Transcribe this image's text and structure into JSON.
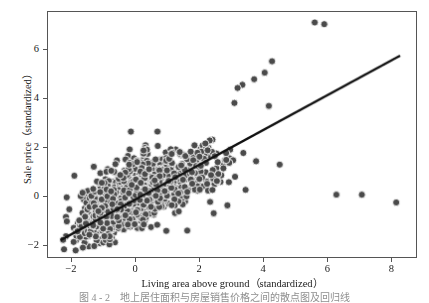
{
  "figure": {
    "background_color": "#ffffff",
    "frame_color": "#555555"
  },
  "caption": {
    "text": "图 4 - 2　地上居住面积与房屋销售价格之间的散点图及回归线",
    "visible": "partially-cut-off"
  },
  "chart_data": {
    "type": "scatter",
    "title": "",
    "xlabel": "Living area above ground（standardized）",
    "ylabel": "Sale price（standardized）",
    "xlim": [
      -2.75,
      8.8
    ],
    "ylim": [
      -2.55,
      7.55
    ],
    "xticks": [
      -2,
      0,
      2,
      4,
      6,
      8
    ],
    "xtick_labels": [
      "−2",
      "0",
      "2",
      "4",
      "6",
      "8"
    ],
    "yticks": [
      -2,
      0,
      2,
      4,
      6
    ],
    "ytick_labels": [
      "−2",
      "0",
      "2",
      "4",
      "6"
    ],
    "grid": false,
    "legend": null,
    "marker": {
      "shape": "circle",
      "face_color": "#4a4a4a",
      "edge_color": "#ffffff",
      "size_px": 7.2,
      "edge_width_px": 0.9
    },
    "trendline": {
      "type": "linear-regression",
      "color": "#111111",
      "width_px": 2.4,
      "x_start": -2.35,
      "y_start": -1.85,
      "x_end": 8.3,
      "y_end": 5.75,
      "slope": 0.7136,
      "intercept": -0.1727
    },
    "n_points": 1460,
    "cluster": {
      "description": "dense positively-correlated cloud",
      "x_mean": 0.0,
      "x_sd": 0.82,
      "y_mean": 0.0,
      "y_sd": 0.78,
      "correlation": 0.71
    },
    "outliers": [
      {
        "x": 5.62,
        "y": 7.12
      },
      {
        "x": 5.92,
        "y": 7.05
      },
      {
        "x": 6.3,
        "y": 0.02
      },
      {
        "x": 7.1,
        "y": 0.02
      },
      {
        "x": 8.18,
        "y": -0.3
      },
      {
        "x": 4.28,
        "y": 5.52
      },
      {
        "x": 4.05,
        "y": 5.05
      },
      {
        "x": 3.72,
        "y": 4.78
      },
      {
        "x": 3.35,
        "y": 4.55
      },
      {
        "x": 3.2,
        "y": 4.42
      },
      {
        "x": 4.18,
        "y": 3.68
      },
      {
        "x": 3.1,
        "y": 3.8
      },
      {
        "x": 3.38,
        "y": 1.74
      },
      {
        "x": 3.78,
        "y": 1.4
      },
      {
        "x": 4.52,
        "y": 1.26
      },
      {
        "x": 3.45,
        "y": 0.22
      },
      {
        "x": 2.88,
        "y": -0.42
      },
      {
        "x": -0.15,
        "y": 2.62
      },
      {
        "x": 1.62,
        "y": -1.46
      },
      {
        "x": -1.3,
        "y": -2.1
      }
    ],
    "series": [
      {
        "name": "Houses",
        "marker_color": "#4a4a4a",
        "x": [],
        "y": []
      }
    ]
  },
  "axis": {
    "x_pixel_left": 47,
    "x_pixel_right": 417,
    "y_pixel_top": 11,
    "y_pixel_bottom": 258
  }
}
